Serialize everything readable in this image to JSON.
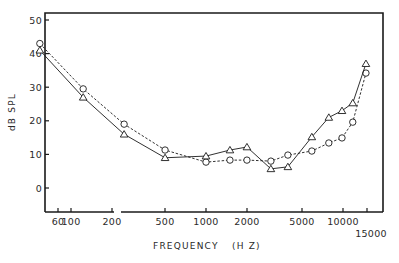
{
  "chart_data": {
    "type": "line",
    "title": "",
    "xlabel": "FREQUENCY",
    "xlabel_units": "(H Z)",
    "ylabel": "dB SPL",
    "xscale": "log",
    "ylim": [
      -5,
      53
    ],
    "grid": false,
    "legend": null,
    "y_ticks": [
      0,
      10,
      20,
      30,
      40,
      50
    ],
    "y_tick_labels": [
      "0",
      "10",
      "20",
      "30",
      "40",
      "50"
    ],
    "x_ticks": [
      60,
      100,
      200,
      500,
      1000,
      2000,
      5000,
      10000,
      15000
    ],
    "x_tick_labels": [
      "60",
      "100",
      "200",
      "500",
      "1000",
      "2000",
      "5000",
      "10000",
      "15000"
    ],
    "series": [
      {
        "name": "circles (dashed)",
        "marker": "circle",
        "line": "dashed",
        "x": [
          60,
          125,
          250,
          500,
          1000,
          1500,
          2000,
          3000,
          4000,
          6000,
          8000,
          10000,
          12000,
          15000
        ],
        "values": [
          43,
          29.5,
          19,
          11.3,
          7.7,
          8.3,
          8.3,
          8,
          9.8,
          11,
          13.4,
          14.9,
          19.6,
          34.2
        ]
      },
      {
        "name": "triangles (solid)",
        "marker": "triangle",
        "line": "solid",
        "x": [
          60,
          125,
          250,
          500,
          1000,
          1500,
          2000,
          3000,
          4000,
          6000,
          8000,
          10000,
          12000,
          15000
        ],
        "values": [
          41,
          27,
          16,
          9,
          9.5,
          11.3,
          12.2,
          5.7,
          6.3,
          15.2,
          21,
          23,
          25.3,
          37
        ]
      }
    ]
  },
  "layout": {
    "frame": {
      "left": 45,
      "top": 13,
      "right": 383,
      "bottom": 212
    },
    "y_px_per_unit": 3.36,
    "y_zero_px": 188,
    "x_tick_px": [
      58,
      71,
      112,
      165,
      206,
      247,
      302,
      343,
      367
    ],
    "x_log_origin_px": 70,
    "x_px_per_decade": 136,
    "axis_break_px": [
      114,
      121
    ],
    "ink_color": "#1a1a1a"
  }
}
